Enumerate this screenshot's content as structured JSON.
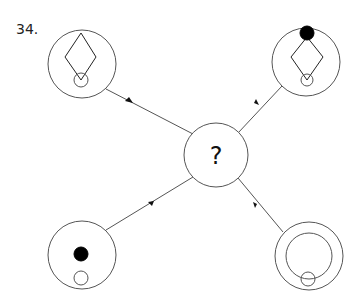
{
  "question": {
    "number_label": "34.",
    "center_label": "?"
  },
  "diagram": {
    "stroke_color": "#555555",
    "fill_color": "#000000",
    "nodes": [
      {
        "id": "top-left",
        "contents": [
          "diamond",
          "small-open-circle-bottom"
        ]
      },
      {
        "id": "top-right",
        "contents": [
          "filled-dot-top",
          "diamond",
          "small-open-circle-bottom"
        ]
      },
      {
        "id": "bottom-left",
        "contents": [
          "filled-dot-center",
          "small-open-circle-bottom"
        ]
      },
      {
        "id": "bottom-right",
        "contents": [
          "inner-ring",
          "small-open-circle-bottom"
        ]
      },
      {
        "id": "center",
        "contents": [
          "question-mark"
        ]
      }
    ],
    "arrows": [
      {
        "from": "top-left",
        "to": "center"
      },
      {
        "from": "top-right",
        "to": "center"
      },
      {
        "from": "bottom-left",
        "to": "center"
      },
      {
        "from": "bottom-right",
        "to": "center"
      }
    ]
  }
}
